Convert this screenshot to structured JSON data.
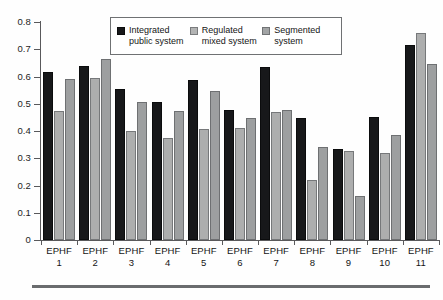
{
  "chart_data": {
    "type": "bar",
    "title": "",
    "subtitle": "",
    "xlabel": "",
    "ylabel": "",
    "ylim": [
      0,
      0.8
    ],
    "ytick_labels": [
      "0.8",
      "0.7",
      "0.6",
      "0.5",
      "0.4",
      "0.3",
      "0.2",
      "0.1",
      "0"
    ],
    "ytick_values": [
      0.8,
      0.7,
      0.6,
      0.5,
      0.4,
      0.3,
      0.2,
      0.1,
      0
    ],
    "grid": false,
    "legend_position": "top-center",
    "categories": [
      "EPHF 1",
      "EPHF 2",
      "EPHF 3",
      "EPHF 4",
      "EPHF 5",
      "EPHF 6",
      "EPHF 7",
      "EPHF 8",
      "EPHF 9",
      "EPHF 10",
      "EPHF 11"
    ],
    "category_lines": [
      [
        "EPHF",
        "1"
      ],
      [
        "EPHF",
        "2"
      ],
      [
        "EPHF",
        "3"
      ],
      [
        "EPHF",
        "4"
      ],
      [
        "EPHF",
        "5"
      ],
      [
        "EPHF",
        "6"
      ],
      [
        "EPHF",
        "7"
      ],
      [
        "EPHF",
        "8"
      ],
      [
        "EPHF",
        "9"
      ],
      [
        "EPHF",
        "10"
      ],
      [
        "EPHF",
        "11"
      ]
    ],
    "series": [
      {
        "name": "Integrated public system",
        "color": "#17181a",
        "values": [
          0.615,
          0.638,
          0.556,
          0.505,
          0.588,
          0.478,
          0.635,
          0.448,
          0.333,
          0.452,
          0.715
        ]
      },
      {
        "name": "Regulated mixed system",
        "color": "#adaeae",
        "values": [
          0.475,
          0.593,
          0.4,
          0.376,
          0.408,
          0.41,
          0.471,
          0.219,
          0.328,
          0.318,
          0.76
        ]
      },
      {
        "name": "Segmented system",
        "color": "#9d9fa0",
        "values": [
          0.59,
          0.663,
          0.505,
          0.473,
          0.546,
          0.446,
          0.476,
          0.341,
          0.163,
          0.386,
          0.645
        ]
      }
    ]
  },
  "legend": {
    "items": [
      {
        "label": "Integrated\npublic system",
        "swatch": "black-swatch-icon"
      },
      {
        "label": "Regulated\nmixed system",
        "swatch": "light-gray-swatch-icon"
      },
      {
        "label": "Segmented\nsystem",
        "swatch": "medium-gray-swatch-icon"
      }
    ]
  }
}
